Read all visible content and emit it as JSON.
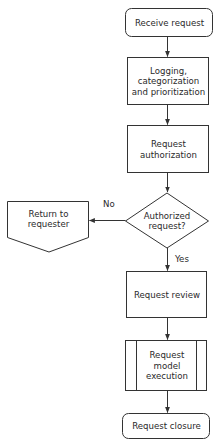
{
  "diagram": {
    "type": "flowchart",
    "stroke_color": "#333333",
    "text_color": "#2a2a2a",
    "nodes": [
      {
        "id": "receive",
        "shape": "rounded-rectangle",
        "label": "Receive request"
      },
      {
        "id": "logging",
        "shape": "rectangle",
        "label": "Logging,\ncategorization\nand prioritization"
      },
      {
        "id": "authorization",
        "shape": "rectangle",
        "label": "Request\nauthorization"
      },
      {
        "id": "decision",
        "shape": "diamond",
        "label": "Authorized\nrequest?"
      },
      {
        "id": "return",
        "shape": "off-page-connector",
        "label": "Return to\nrequester"
      },
      {
        "id": "review",
        "shape": "rectangle",
        "label": "Request review"
      },
      {
        "id": "model",
        "shape": "predefined-process",
        "label": "Request\nmodel\nexecution"
      },
      {
        "id": "closure",
        "shape": "rounded-rectangle",
        "label": "Request closure"
      }
    ],
    "edges": [
      {
        "from": "receive",
        "to": "logging",
        "label": ""
      },
      {
        "from": "logging",
        "to": "authorization",
        "label": ""
      },
      {
        "from": "authorization",
        "to": "decision",
        "label": ""
      },
      {
        "from": "decision",
        "to": "return",
        "label": "No"
      },
      {
        "from": "decision",
        "to": "review",
        "label": "Yes"
      },
      {
        "from": "review",
        "to": "model",
        "label": ""
      },
      {
        "from": "model",
        "to": "closure",
        "label": ""
      }
    ]
  }
}
